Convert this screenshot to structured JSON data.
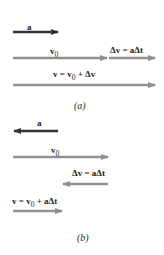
{
  "colors": {
    "acceleration": "#333333",
    "velocity": "#8f8f8f",
    "background": "#ffffff"
  },
  "panel_a": {
    "caption": "(a)",
    "acceleration": {
      "label": "a",
      "direction": "right"
    },
    "initial_velocity": {
      "label": "v",
      "sub": "0",
      "direction": "right"
    },
    "delta_v": {
      "label": "Δv = aΔt",
      "direction": "right"
    },
    "final_velocity": {
      "label": "v = v",
      "sub": "0",
      "tail": " + Δv",
      "direction": "right"
    }
  },
  "panel_b": {
    "caption": "(b)",
    "acceleration": {
      "label": "a",
      "direction": "left"
    },
    "initial_velocity": {
      "label": "v",
      "sub": "0",
      "direction": "right"
    },
    "delta_v": {
      "label": "Δv = aΔt",
      "direction": "left"
    },
    "final_velocity": {
      "label": "v = v",
      "sub": "0",
      "tail": " + aΔt",
      "direction": "right"
    }
  }
}
